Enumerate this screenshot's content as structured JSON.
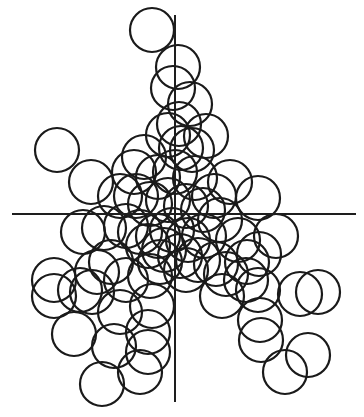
{
  "diagram": {
    "type": "overlapping-circle-scatter",
    "canvas": {
      "width": 364,
      "height": 417,
      "background": "#ffffff"
    },
    "stroke_color": "#1a1a1a",
    "axes": {
      "horizontal": {
        "x1": 12,
        "x2": 356,
        "y": 214
      },
      "vertical": {
        "x": 175,
        "y1": 15,
        "y2": 402
      }
    },
    "circle_radius": 22,
    "circles": [
      [
        152,
        30
      ],
      [
        178,
        67
      ],
      [
        173,
        88
      ],
      [
        190,
        104
      ],
      [
        179,
        124
      ],
      [
        168,
        135
      ],
      [
        206,
        136
      ],
      [
        192,
        150
      ],
      [
        181,
        148
      ],
      [
        57,
        150
      ],
      [
        91,
        182
      ],
      [
        144,
        157
      ],
      [
        134,
        172
      ],
      [
        158,
        177
      ],
      [
        175,
        172
      ],
      [
        195,
        178
      ],
      [
        230,
        182
      ],
      [
        258,
        198
      ],
      [
        214,
        196
      ],
      [
        120,
        196
      ],
      [
        136,
        196
      ],
      [
        150,
        204
      ],
      [
        168,
        200
      ],
      [
        186,
        206
      ],
      [
        203,
        210
      ],
      [
        220,
        220
      ],
      [
        83,
        232
      ],
      [
        104,
        228
      ],
      [
        126,
        226
      ],
      [
        140,
        232
      ],
      [
        158,
        236
      ],
      [
        172,
        230
      ],
      [
        188,
        240
      ],
      [
        204,
        236
      ],
      [
        238,
        240
      ],
      [
        276,
        236
      ],
      [
        259,
        254
      ],
      [
        247,
        262
      ],
      [
        148,
        246
      ],
      [
        164,
        250
      ],
      [
        180,
        256
      ],
      [
        198,
        260
      ],
      [
        216,
        264
      ],
      [
        160,
        262
      ],
      [
        186,
        270
      ],
      [
        111,
        262
      ],
      [
        97,
        272
      ],
      [
        126,
        280
      ],
      [
        150,
        276
      ],
      [
        80,
        290
      ],
      [
        54,
        280
      ],
      [
        54,
        296
      ],
      [
        92,
        292
      ],
      [
        226,
        274
      ],
      [
        246,
        280
      ],
      [
        222,
        296
      ],
      [
        258,
        290
      ],
      [
        300,
        294
      ],
      [
        318,
        292
      ],
      [
        260,
        320
      ],
      [
        120,
        312
      ],
      [
        152,
        306
      ],
      [
        148,
        332
      ],
      [
        74,
        334
      ],
      [
        114,
        346
      ],
      [
        148,
        352
      ],
      [
        102,
        384
      ],
      [
        140,
        372
      ],
      [
        261,
        340
      ],
      [
        285,
        372
      ],
      [
        308,
        355
      ]
    ]
  }
}
